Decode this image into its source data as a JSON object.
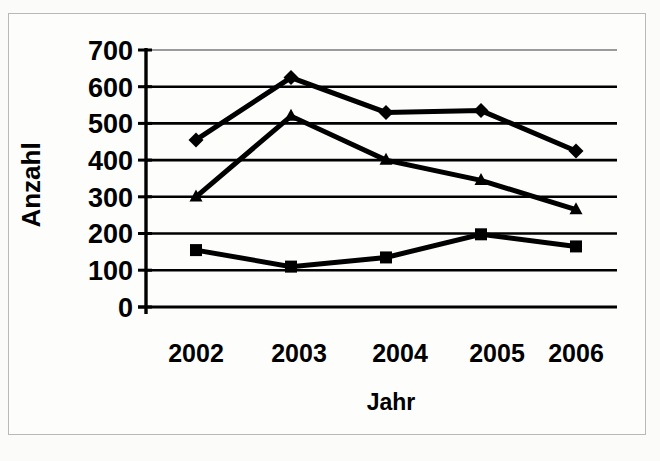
{
  "figure": {
    "background_color": "#fdfdfc",
    "frame_color": "#b9b9bb",
    "ink_color": "#000000"
  },
  "chart_data": {
    "type": "line",
    "title": "",
    "subtitle": "",
    "xlabel": "Jahr",
    "ylabel": "Anzahl",
    "categories": [
      "2002",
      "2003",
      "2004",
      "2005",
      "2006"
    ],
    "x": [
      2002,
      2003,
      2004,
      2005,
      2006
    ],
    "ylim": [
      0,
      700
    ],
    "yticks": [
      0,
      100,
      200,
      300,
      400,
      500,
      600,
      700
    ],
    "ytick_labels": [
      "0",
      "100",
      "200",
      "300",
      "400",
      "500",
      "600",
      "700"
    ],
    "grid": "horizontal",
    "legend": "none",
    "series": [
      {
        "name": "series-1",
        "marker": "diamond",
        "color": "#000000",
        "values": [
          455,
          625,
          530,
          535,
          425
        ]
      },
      {
        "name": "series-2",
        "marker": "triangle",
        "color": "#000000",
        "values": [
          300,
          520,
          400,
          345,
          265
        ]
      },
      {
        "name": "series-3",
        "marker": "square",
        "color": "#000000",
        "values": [
          155,
          110,
          135,
          198,
          165
        ]
      }
    ]
  },
  "axes": {
    "y_title": "Anzahl",
    "x_title": "Jahr",
    "y_labels": [
      "700",
      "600",
      "500",
      "400",
      "300",
      "200",
      "100",
      "0"
    ],
    "x_labels": [
      "2002",
      "2003",
      "2004",
      "2005",
      "2006"
    ]
  }
}
